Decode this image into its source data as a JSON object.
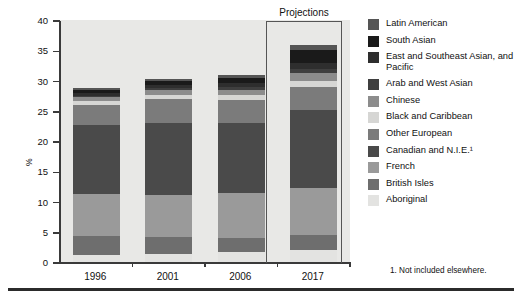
{
  "chart_data": {
    "type": "bar",
    "title": "",
    "subtitle": "",
    "xlabel": "",
    "ylabel": "%",
    "categories": [
      "1996",
      "2001",
      "2006",
      "2017"
    ],
    "ylim": [
      0,
      40
    ],
    "yticks": [
      0,
      5,
      10,
      15,
      20,
      25,
      30,
      35,
      40
    ],
    "grid": false,
    "stacked": true,
    "legend_position": "right",
    "annotations": [
      "Projections"
    ],
    "series": [
      {
        "name": "Aboriginal",
        "color": "#e3e3e1",
        "values": [
          1.1,
          1.3,
          1.6,
          2.0
        ]
      },
      {
        "name": "British Isles",
        "color": "#6e6e6e",
        "values": [
          3.2,
          2.8,
          2.4,
          2.5
        ]
      },
      {
        "name": "French",
        "color": "#9a9a9a",
        "values": [
          6.9,
          7.0,
          7.4,
          7.7
        ]
      },
      {
        "name": "Canadian and N.I.E.",
        "color": "#4a4a4a",
        "values": [
          11.4,
          11.9,
          11.5,
          12.9
        ]
      },
      {
        "name": "Other European",
        "color": "#7b7b7b",
        "values": [
          3.3,
          3.9,
          3.9,
          3.9
        ]
      },
      {
        "name": "Black and Caribbean",
        "color": "#d6d6d4",
        "values": [
          0.7,
          0.7,
          0.8,
          0.9
        ]
      },
      {
        "name": "Chinese",
        "color": "#8c8c8c",
        "values": [
          0.7,
          0.8,
          0.9,
          1.4
        ]
      },
      {
        "name": "Arab and West Asian",
        "color": "#3f3f3f",
        "values": [
          0.2,
          0.3,
          0.4,
          0.6
        ]
      },
      {
        "name": "East and Southeast Asian, and Pacific",
        "color": "#2e2e2e",
        "values": [
          0.4,
          0.5,
          0.7,
          1.0
        ]
      },
      {
        "name": "South Asian",
        "color": "#1a1a1a",
        "values": [
          0.6,
          0.7,
          0.9,
          2.1
        ]
      },
      {
        "name": "Latin American",
        "color": "#555555",
        "values": [
          0.3,
          0.3,
          0.4,
          0.8
        ]
      }
    ],
    "totals": [
      28.8,
      30.2,
      30.8,
      35.8
    ]
  },
  "axis": {
    "y_title": "%",
    "y_tick_labels": [
      "40",
      "35",
      "30",
      "25",
      "20",
      "15",
      "10",
      "5",
      "0"
    ],
    "x_tick_labels": [
      "1996",
      "2001",
      "2006",
      "2017"
    ]
  },
  "projections": {
    "label": "Projections"
  },
  "legend": {
    "items": [
      {
        "label": "Latin American",
        "color": "#555555"
      },
      {
        "label": "South Asian",
        "color": "#1a1a1a"
      },
      {
        "label": "East and Southeast Asian, and Pacific",
        "color": "#2e2e2e"
      },
      {
        "label": "Arab and West Asian",
        "color": "#3f3f3f"
      },
      {
        "label": "Chinese",
        "color": "#8c8c8c"
      },
      {
        "label": "Black and Caribbean",
        "color": "#d6d6d4"
      },
      {
        "label": "Other European",
        "color": "#7b7b7b"
      },
      {
        "label": "Canadian and N.I.E.¹",
        "color": "#4a4a4a"
      },
      {
        "label": "French",
        "color": "#9a9a9a"
      },
      {
        "label": "British Isles",
        "color": "#6e6e6e"
      },
      {
        "label": "Aboriginal",
        "color": "#e3e3e1"
      }
    ]
  },
  "footnote": {
    "text": "1. Not included elsewhere."
  },
  "colors": {
    "plot_background": "#e8e8e6",
    "axis": "#3a3a3a",
    "text": "#111111",
    "rule": "#2b2b2b"
  }
}
